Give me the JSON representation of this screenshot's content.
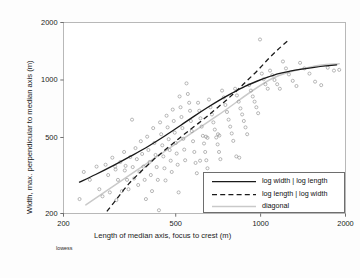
{
  "chart_data": {
    "type": "scatter",
    "title": "",
    "xlabel": "Length of median axis, focus to crest (m)",
    "ylabel": "Width, max. perpendicular to median axis (m)",
    "xscale": "log",
    "yscale": "log",
    "xlim": [
      200,
      2000
    ],
    "ylim": [
      200,
      2000
    ],
    "xticks": [
      200,
      500,
      1000,
      2000
    ],
    "yticks": [
      200,
      500,
      1000,
      2000
    ],
    "xticklabels": [
      "200",
      "500",
      "1000",
      "2000"
    ],
    "yticklabels": [
      "200",
      "500",
      "1000",
      "2000"
    ],
    "grid": false,
    "marker": "open-circle",
    "note": "lowess",
    "legend_position": "lower-right",
    "legend": [
      {
        "label": "log width | log length",
        "style": "solid",
        "color": "#1a1a1a"
      },
      {
        "label": "log length | log width",
        "style": "dashed",
        "color": "#1a1a1a"
      },
      {
        "label": "diagonal",
        "style": "solid",
        "color": "#c8c8c8"
      }
    ],
    "points": [
      [
        228,
        238
      ],
      [
        236,
        330
      ],
      [
        248,
        300
      ],
      [
        262,
        352
      ],
      [
        268,
        268
      ],
      [
        275,
        246
      ],
      [
        282,
        360
      ],
      [
        288,
        318
      ],
      [
        292,
        258
      ],
      [
        298,
        392
      ],
      [
        305,
        352
      ],
      [
        308,
        235
      ],
      [
        312,
        300
      ],
      [
        318,
        372
      ],
      [
        322,
        262
      ],
      [
        328,
        420
      ],
      [
        332,
        355
      ],
      [
        336,
        300
      ],
      [
        340,
        268
      ],
      [
        345,
        395
      ],
      [
        350,
        620
      ],
      [
        352,
        350
      ],
      [
        356,
        305
      ],
      [
        360,
        440
      ],
      [
        364,
        385
      ],
      [
        368,
        282
      ],
      [
        372,
        330
      ],
      [
        376,
        478
      ],
      [
        380,
        410
      ],
      [
        384,
        352
      ],
      [
        388,
        300
      ],
      [
        392,
        238
      ],
      [
        396,
        505
      ],
      [
        400,
        430
      ],
      [
        404,
        372
      ],
      [
        408,
        318
      ],
      [
        412,
        262
      ],
      [
        416,
        560
      ],
      [
        420,
        468
      ],
      [
        424,
        405
      ],
      [
        428,
        350
      ],
      [
        432,
        300
      ],
      [
        436,
        208
      ],
      [
        440,
        600
      ],
      [
        444,
        520
      ],
      [
        448,
        455
      ],
      [
        452,
        398
      ],
      [
        456,
        345
      ],
      [
        460,
        298
      ],
      [
        464,
        650
      ],
      [
        468,
        565
      ],
      [
        472,
        490
      ],
      [
        476,
        430
      ],
      [
        480,
        378
      ],
      [
        484,
        330
      ],
      [
        488,
        700
      ],
      [
        492,
        610
      ],
      [
        496,
        530
      ],
      [
        500,
        468
      ],
      [
        504,
        412
      ],
      [
        508,
        360
      ],
      [
        512,
        258
      ],
      [
        516,
        820
      ],
      [
        520,
        720
      ],
      [
        524,
        640
      ],
      [
        528,
        560
      ],
      [
        532,
        492
      ],
      [
        536,
        432
      ],
      [
        540,
        380
      ],
      [
        546,
        960
      ],
      [
        552,
        845
      ],
      [
        558,
        760
      ],
      [
        562,
        690
      ],
      [
        566,
        610
      ],
      [
        570,
        540
      ],
      [
        576,
        478
      ],
      [
        582,
        420
      ],
      [
        588,
        368
      ],
      [
        594,
        325
      ],
      [
        600,
        760
      ],
      [
        606,
        690
      ],
      [
        612,
        630
      ],
      [
        618,
        570
      ],
      [
        624,
        510
      ],
      [
        630,
        465
      ],
      [
        636,
        420
      ],
      [
        642,
        380
      ],
      [
        648,
        345
      ],
      [
        656,
        790
      ],
      [
        664,
        720
      ],
      [
        672,
        660
      ],
      [
        680,
        600
      ],
      [
        688,
        550
      ],
      [
        696,
        500
      ],
      [
        704,
        460
      ],
      [
        712,
        420
      ],
      [
        720,
        385
      ],
      [
        730,
        880
      ],
      [
        740,
        810
      ],
      [
        750,
        740
      ],
      [
        760,
        680
      ],
      [
        770,
        620
      ],
      [
        780,
        570
      ],
      [
        790,
        525
      ],
      [
        800,
        480
      ],
      [
        812,
        900
      ],
      [
        824,
        830
      ],
      [
        836,
        770
      ],
      [
        848,
        710
      ],
      [
        860,
        660
      ],
      [
        872,
        610
      ],
      [
        884,
        565
      ],
      [
        896,
        520
      ],
      [
        910,
        940
      ],
      [
        924,
        880
      ],
      [
        938,
        820
      ],
      [
        952,
        770
      ],
      [
        966,
        720
      ],
      [
        980,
        670
      ],
      [
        995,
        1630
      ],
      [
        1010,
        1080
      ],
      [
        1025,
        1010
      ],
      [
        1040,
        950
      ],
      [
        1060,
        900
      ],
      [
        1080,
        1120
      ],
      [
        1100,
        1060
      ],
      [
        1120,
        1000
      ],
      [
        1145,
        950
      ],
      [
        1170,
        900
      ],
      [
        1200,
        1250
      ],
      [
        1230,
        1150
      ],
      [
        1260,
        1070
      ],
      [
        1300,
        990
      ],
      [
        1340,
        930
      ],
      [
        1380,
        1230
      ],
      [
        1430,
        1150
      ],
      [
        1490,
        1080
      ],
      [
        1560,
        980
      ],
      [
        1640,
        940
      ],
      [
        1730,
        1160
      ],
      [
        1820,
        1120
      ],
      [
        1900,
        1130
      ],
      [
        820,
        398
      ],
      [
        840,
        392
      ],
      [
        706,
        520
      ],
      [
        714,
        512
      ],
      [
        640,
        505
      ],
      [
        648,
        498
      ],
      [
        610,
        378
      ],
      [
        306,
        340
      ],
      [
        330,
        336
      ]
    ],
    "curves": [
      {
        "name": "log width | log length",
        "style": "solid",
        "color": "#1a1a1a",
        "points": [
          [
            228,
            292
          ],
          [
            260,
            320
          ],
          [
            300,
            356
          ],
          [
            345,
            398
          ],
          [
            400,
            450
          ],
          [
            460,
            512
          ],
          [
            520,
            578
          ],
          [
            580,
            645
          ],
          [
            650,
            720
          ],
          [
            720,
            790
          ],
          [
            800,
            860
          ],
          [
            880,
            925
          ],
          [
            970,
            985
          ],
          [
            1060,
            1035
          ],
          [
            1160,
            1080
          ],
          [
            1270,
            1112
          ],
          [
            1400,
            1140
          ],
          [
            1550,
            1165
          ],
          [
            1700,
            1185
          ],
          [
            1860,
            1200
          ]
        ]
      },
      {
        "name": "log length | log width",
        "style": "dashed",
        "color": "#1a1a1a",
        "points": [
          [
            285,
            205
          ],
          [
            310,
            240
          ],
          [
            340,
            285
          ],
          [
            375,
            330
          ],
          [
            415,
            380
          ],
          [
            460,
            432
          ],
          [
            510,
            490
          ],
          [
            565,
            552
          ],
          [
            625,
            620
          ],
          [
            690,
            700
          ],
          [
            760,
            790
          ],
          [
            830,
            890
          ],
          [
            900,
            1000
          ],
          [
            980,
            1130
          ],
          [
            1060,
            1280
          ],
          [
            1150,
            1440
          ],
          [
            1245,
            1600
          ]
        ]
      },
      {
        "name": "diagonal",
        "style": "solid",
        "color": "#c9c9c9",
        "points": [
          [
            240,
            222
          ],
          [
            400,
            370
          ],
          [
            700,
            648
          ],
          [
            1100,
            1018
          ],
          [
            1600,
            1190
          ],
          [
            1900,
            1215
          ]
        ]
      }
    ]
  }
}
